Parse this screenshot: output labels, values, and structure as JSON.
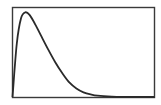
{
  "chart_data": {
    "type": "line",
    "title": "",
    "xlabel": "",
    "ylabel": "",
    "grid": false,
    "legend": null,
    "xlim": [
      0,
      10
    ],
    "ylim": [
      0,
      1
    ],
    "series": [
      {
        "name": "density",
        "x": [
          0,
          0.3,
          0.6,
          0.9,
          1.2,
          1.6,
          2.0,
          2.5,
          3.0,
          3.5,
          4.0,
          4.5,
          5.0,
          5.5,
          6.0,
          7.0,
          8.0,
          9.0,
          10.0
        ],
        "values": [
          0,
          0.62,
          0.92,
          0.99,
          0.96,
          0.85,
          0.72,
          0.56,
          0.41,
          0.28,
          0.17,
          0.1,
          0.055,
          0.03,
          0.015,
          0.005,
          0.002,
          0.001,
          0.0
        ]
      }
    ],
    "frame_color": "#3a3a3a",
    "line_color": "#2a2a2a"
  }
}
